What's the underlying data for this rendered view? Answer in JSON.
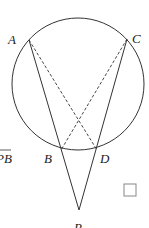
{
  "diagram": {
    "title": "",
    "circle": {
      "cx": 78,
      "cy": 84,
      "r": 66
    },
    "points": [
      {
        "id": "A",
        "label": "A",
        "x": 29,
        "y": 40,
        "lx": 8,
        "ly": 44
      },
      {
        "id": "C",
        "label": "C",
        "x": 127,
        "y": 39,
        "lx": 132,
        "ly": 43
      },
      {
        "id": "B",
        "label": "B",
        "x": 61,
        "y": 150,
        "lx": 44,
        "ly": 163
      },
      {
        "id": "D",
        "label": "D",
        "x": 97,
        "y": 150,
        "lx": 100,
        "ly": 163
      },
      {
        "id": "P",
        "label": "P",
        "x": 79,
        "y": 210,
        "lx": 74,
        "ly": 230
      }
    ],
    "solid_segments": [
      [
        "A",
        "P"
      ],
      [
        "C",
        "P"
      ]
    ],
    "dashed_segments": [
      [
        "A",
        "D"
      ],
      [
        "C",
        "B"
      ]
    ],
    "edge_text": "PB",
    "answer_box": "empty-checkbox"
  }
}
